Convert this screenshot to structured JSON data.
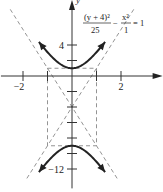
{
  "chart_data": {
    "type": "line",
    "title": "",
    "equation": {
      "num1": "(y + 4)²",
      "den1": "25",
      "minus": "−",
      "num2": "x²",
      "den2": "1",
      "rhs": "= 1"
    },
    "xlabel": "x",
    "ylabel": "y",
    "xlim": [
      -2.9,
      3.7
    ],
    "ylim": [
      -14.5,
      9.8
    ],
    "x_ticks": [
      -2,
      -1,
      1,
      2
    ],
    "x_tick_labels": [
      {
        "value": -2,
        "label": "−2"
      },
      {
        "value": 2,
        "label": "2"
      }
    ],
    "y_ticks": [
      4,
      -4,
      -6,
      -8,
      -10,
      -12,
      2,
      -2
    ],
    "y_tick_labels": [
      {
        "value": 4,
        "label": "4"
      },
      {
        "value": -12,
        "label": "−12"
      }
    ],
    "hyperbola": {
      "center": [
        0,
        -4
      ],
      "a": 5,
      "b": 1,
      "orientation": "vertical"
    },
    "vertices": [
      [
        0,
        1
      ],
      [
        0,
        -9
      ]
    ],
    "asymptotes": [
      "y + 4 = 5x",
      "y + 4 = −5x"
    ],
    "fundamental_rectangle": {
      "x": [
        -1,
        1
      ],
      "y": [
        -9,
        1
      ]
    },
    "branch_x_range": [
      -1.35,
      1.35
    ],
    "grid": false,
    "legend": "none"
  }
}
